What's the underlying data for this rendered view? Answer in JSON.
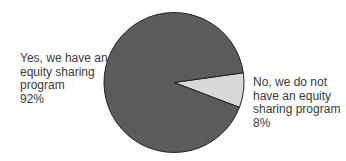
{
  "chart_data": {
    "type": "pie",
    "title": "",
    "slices": [
      {
        "name": "Yes, we have an equity sharing program",
        "value": 92,
        "label_lines": [
          "Yes, we have an",
          "equity sharing",
          "program",
          "92%"
        ],
        "color": "#5c5c5c"
      },
      {
        "name": "No, we do not have an equity sharing program",
        "value": 8,
        "label_lines": [
          "No, we do not",
          "have an equity",
          "sharing program",
          "8%"
        ],
        "color": "#d8d8d8"
      }
    ],
    "legend": "none (direct labels)",
    "stroke_color": "#222222"
  }
}
